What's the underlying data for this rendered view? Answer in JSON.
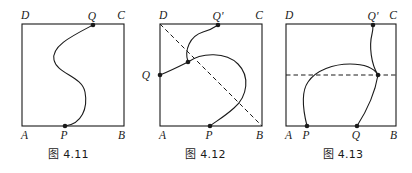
{
  "page": {
    "background_color": "#ffffff",
    "ink_color": "#1a1a1a",
    "width": 412,
    "height": 173
  },
  "figures": [
    {
      "id": "fig-4-11",
      "caption": "图 4.11",
      "rect_labels": {
        "top_left": "D",
        "top_right": "C",
        "bottom_left": "A",
        "bottom_right": "B"
      },
      "points": [
        {
          "label": "P",
          "x": 65,
          "y": 126,
          "label_dx": -1,
          "label_dy": 13
        },
        {
          "label": "Q",
          "x": 93,
          "y": 25,
          "label_dx": -1,
          "label_dy": -5
        }
      ],
      "curves": [
        {
          "name": "s-curve-PQ",
          "style": "solid",
          "d": "M 65 126 C 82 124 88 108 85 92 C 82 76 57 74 54 60 C 51 46 72 36 93 25"
        }
      ],
      "dashed_lines": []
    },
    {
      "id": "fig-4-12",
      "caption": "图 4.12",
      "rect_labels": {
        "top_left": "D",
        "top_right": "C",
        "bottom_left": "A",
        "bottom_right": "B"
      },
      "points": [
        {
          "label": "P",
          "x": 210,
          "y": 126,
          "label_dx": -1,
          "label_dy": 13
        },
        {
          "label": "Q",
          "x": 160,
          "y": 75,
          "label_dx": -10,
          "label_dy": 4
        },
        {
          "label": "Q'",
          "x": 218,
          "y": 25,
          "label_dx": 0,
          "label_dy": -5
        },
        {
          "label": "",
          "x": 188,
          "y": 62,
          "label_dx": 0,
          "label_dy": 0
        }
      ],
      "curves": [
        {
          "name": "branch-Q-to-node",
          "style": "solid",
          "d": "M 160 75 C 170 71 180 66 188 62"
        },
        {
          "name": "branch-node-to-Qprime",
          "style": "solid",
          "d": "M 188 62 C 184 50 190 36 203 32 C 211 30 215 27 218 25"
        },
        {
          "name": "branch-node-loop-to-P",
          "style": "solid",
          "d": "M 188 62 C 202 52 226 52 238 64 C 250 76 248 96 234 108 C 224 117 215 122 210 126"
        }
      ],
      "dashed_lines": [
        {
          "name": "diagonal-D-to-B",
          "x1": 160,
          "y1": 24,
          "x2": 262,
          "y2": 126
        }
      ]
    },
    {
      "id": "fig-4-13",
      "caption": "图 4.13",
      "rect_labels": {
        "top_left": "D",
        "top_right": "C",
        "bottom_left": "A",
        "bottom_right": "B"
      },
      "points": [
        {
          "label": "P",
          "x": 307,
          "y": 126,
          "label_dx": -1,
          "label_dy": 13
        },
        {
          "label": "Q",
          "x": 357,
          "y": 126,
          "label_dx": -1,
          "label_dy": 13
        },
        {
          "label": "Q'",
          "x": 373,
          "y": 25,
          "label_dx": 0,
          "label_dy": -5
        },
        {
          "label": "",
          "x": 378,
          "y": 75,
          "label_dx": 0,
          "label_dy": 0
        }
      ],
      "curves": [
        {
          "name": "arch-P-over-to-node",
          "style": "solid",
          "d": "M 307 126 C 303 110 301 92 308 82 C 316 70 334 64 350 64 C 364 64 374 68 378 75"
        },
        {
          "name": "node-down-to-Q",
          "style": "solid",
          "d": "M 378 75 C 375 93 366 112 357 126"
        },
        {
          "name": "node-up-to-Qprime",
          "style": "solid",
          "d": "M 378 75 C 371 64 369 46 372 34 C 373 30 373 27 373 25"
        }
      ],
      "dashed_lines": [
        {
          "name": "horizontal-chord",
          "x1": 286,
          "y1": 75,
          "x2": 396,
          "y2": 75
        }
      ]
    }
  ],
  "rects": [
    {
      "id": "fig-4-11",
      "x": 22,
      "y": 24,
      "w": 102,
      "h": 102
    },
    {
      "id": "fig-4-12",
      "x": 160,
      "y": 24,
      "w": 102,
      "h": 102
    },
    {
      "id": "fig-4-13",
      "x": 286,
      "y": 24,
      "w": 110,
      "h": 102
    }
  ]
}
